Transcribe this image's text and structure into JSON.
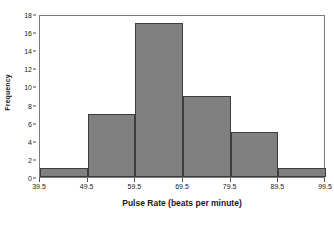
{
  "chart_data": {
    "type": "bar",
    "title": "",
    "xlabel": "Pulse Rate (beats per minute)",
    "ylabel": "Frequency",
    "categories": [
      "39.5-49.5",
      "49.5-59.5",
      "59.5-69.5",
      "69.5-79.5",
      "79.5-89.5",
      "89.5-99.5"
    ],
    "values": [
      1,
      7,
      17,
      9,
      5,
      1
    ],
    "bin_edges": [
      39.5,
      49.5,
      59.5,
      69.5,
      79.5,
      89.5,
      99.5
    ],
    "xlim": [
      39.5,
      99.5
    ],
    "ylim": [
      0,
      18
    ],
    "x_tick_labels": [
      "39.5",
      "49.5",
      "59.5",
      "69.5",
      "79.5",
      "89.5",
      "99.5"
    ],
    "y_tick_labels": [
      "0",
      "2",
      "4",
      "6",
      "8",
      "10",
      "12",
      "14",
      "16",
      "18"
    ],
    "y_tick_values": [
      0,
      2,
      4,
      6,
      8,
      10,
      12,
      14,
      16,
      18
    ],
    "grid": false,
    "legend": "none",
    "bar_color": "#808080",
    "bar_edge_color": "#3d3d3d",
    "frame_color": "#7a7a7a",
    "background_color": "#ffffff"
  }
}
